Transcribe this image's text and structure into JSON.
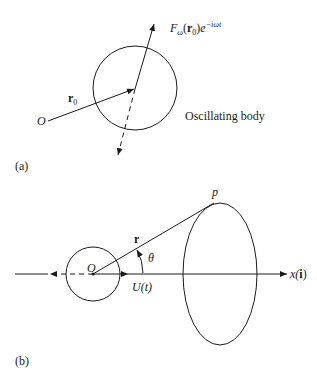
{
  "panel_a": {
    "tag": "(a)",
    "origin_label": "O",
    "position_vector_label": "r",
    "position_vector_sub": "0",
    "force_label": {
      "F": "F",
      "F_sub": "ω",
      "arg_open": "(",
      "arg_vec": "r",
      "arg_sub": "0",
      "arg_close": ")",
      "exp_base": "e",
      "exp_power": "−iωt"
    },
    "body_label": "Oscillating body"
  },
  "panel_b": {
    "tag": "(b)",
    "origin_label": "O",
    "point_label": "p",
    "radius_vector_label": "r",
    "angle_label": "θ",
    "velocity_label": "U(t)",
    "axis_label": "x(",
    "axis_unit_vector": "i",
    "axis_label_close": ")"
  },
  "colors": {
    "stroke": "#1a1a1a",
    "background": "#ffffff"
  }
}
